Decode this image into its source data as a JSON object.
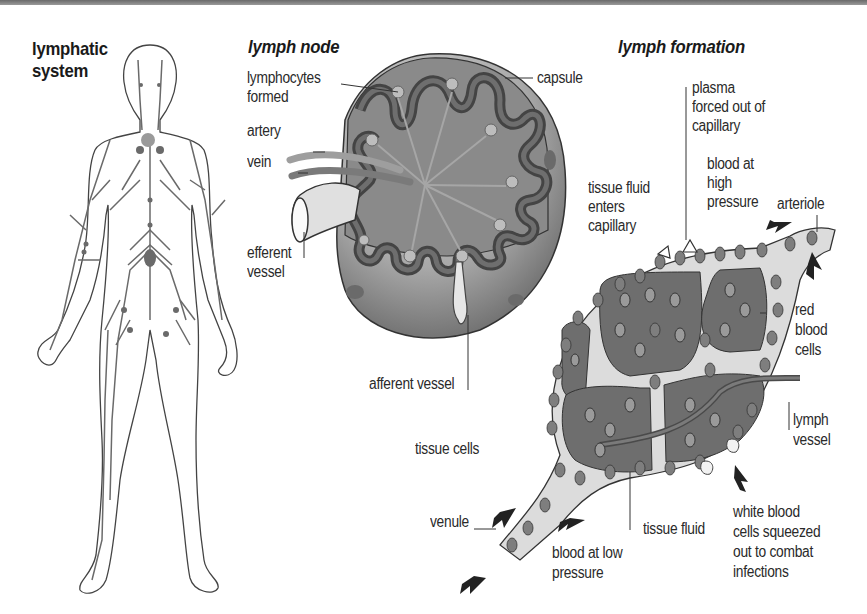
{
  "colors": {
    "background": "#ffffff",
    "outline": "#3a3a3a",
    "dark_gray": "#5a5a5a",
    "mid_gray": "#7c7c7c",
    "light_gray": "#c8c8c8",
    "top_border": "#7a7a7a"
  },
  "panels": {
    "lymphatic_system": {
      "title_line1": "lymphatic",
      "title_line2": "system"
    },
    "lymph_node": {
      "title": "lymph node",
      "labels": {
        "lymphocytes_line1": "lymphocytes",
        "lymphocytes_line2": "formed",
        "capsule": "capsule",
        "artery": "artery",
        "vein": "vein",
        "efferent_line1": "efferent",
        "efferent_line2": "vessel",
        "afferent": "afferent vessel"
      }
    },
    "lymph_formation": {
      "title": "lymph formation",
      "labels": {
        "plasma_line1": "plasma",
        "plasma_line2": "forced out of",
        "plasma_line3": "capillary",
        "blood_high_line1": "blood at",
        "blood_high_line2": "high",
        "blood_high_line3": "pressure",
        "arteriole": "arteriole",
        "tissue_fluid_enters_line1": "tissue fluid",
        "tissue_fluid_enters_line2": "enters",
        "tissue_fluid_enters_line3": "capillary",
        "red_blood_line1": "red",
        "red_blood_line2": "blood",
        "red_blood_line3": "cells",
        "lymph_vessel_line1": "lymph",
        "lymph_vessel_line2": "vessel",
        "tissue_cells": "tissue cells",
        "venule": "venule",
        "tissue_fluid": "tissue fluid",
        "blood_low_line1": "blood at low",
        "blood_low_line2": "pressure",
        "wbc_line1": "white blood",
        "wbc_line2": "cells squeezed",
        "wbc_line3": "out to combat",
        "wbc_line4": "infections"
      }
    }
  }
}
